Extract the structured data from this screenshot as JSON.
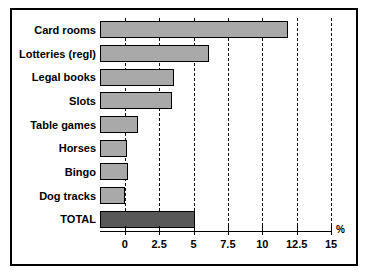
{
  "chart_data": {
    "type": "bar",
    "orientation": "horizontal",
    "title": "",
    "subtitle": "",
    "xlabel": "%",
    "ylabel": "",
    "xlim": [
      -1.8,
      15
    ],
    "grid": true,
    "legend": null,
    "categories": [
      "Card rooms",
      "Lotteries (regl)",
      "Legal books",
      "Slots",
      "Table games",
      "Horses",
      "Bingo",
      "Dog tracks",
      "TOTAL"
    ],
    "values": [
      11.9,
      6.1,
      3.6,
      3.4,
      0.95,
      0.15,
      0.2,
      0.0,
      5.1
    ],
    "bar_start": -1.8,
    "xticks": [
      0,
      2.5,
      5,
      7.5,
      10,
      12.5,
      15
    ],
    "xtick_labels": [
      "0",
      "2.5",
      "5",
      "7.5",
      "10",
      "12.5",
      "15"
    ],
    "colors": {
      "bar_fill": "#a9a9a9",
      "total_fill": "#585858",
      "bar_edge": "#000000",
      "gridline": "#111111",
      "axis": "#000000",
      "background": "#ffffff",
      "frame": "#000000"
    }
  },
  "axis": {
    "unit_label": "%"
  }
}
